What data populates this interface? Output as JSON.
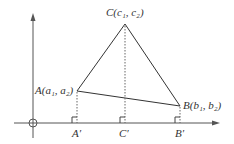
{
  "figure": {
    "type": "coordinate-geometry-diagram",
    "points": {
      "A": {
        "label": "A(a₁, a₂)",
        "x": 77,
        "y": 91
      },
      "B": {
        "label": "B(b₁, b₂)",
        "x": 180,
        "y": 106
      },
      "C": {
        "label": "C(c₁, c₂)",
        "x": 125,
        "y": 24
      }
    },
    "projections": {
      "A_prime": {
        "label": "A′",
        "x": 77
      },
      "B_prime": {
        "label": "B′",
        "x": 180
      },
      "C_prime": {
        "label": "C′",
        "x": 125
      }
    },
    "axes": {
      "origin": {
        "x": 33,
        "y": 123
      },
      "x_axis_end": 218,
      "y_axis_top": 14
    },
    "colors": {
      "line": "#333333",
      "axis": "#555555",
      "dotted": "#666666"
    }
  }
}
